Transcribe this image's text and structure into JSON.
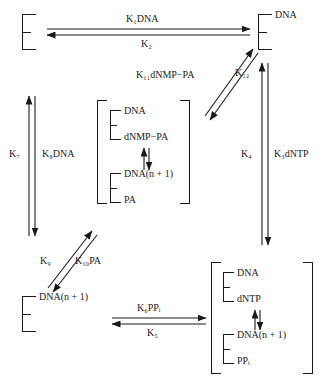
{
  "diagram": {
    "type": "reaction-scheme",
    "species": {
      "enzyme": "E",
      "dna": "DNA",
      "dnmp_pa": "dNMP−PA",
      "dna_n1": "DNA(n + 1)",
      "pa": "PA",
      "dntp": "dNTP",
      "ppi": "PP",
      "ppi_sub": "i"
    },
    "nodes": {
      "top_left": {
        "enzyme": "E",
        "ligands": []
      },
      "top_right": {
        "enzyme": "E",
        "ligands": [
          "DNA"
        ]
      },
      "center": {
        "enzyme_upper": "E",
        "upper": [
          "DNA",
          "dNMP−PA"
        ],
        "enzyme_lower": "E",
        "lower": [
          "DNA(n + 1)",
          "PA"
        ]
      },
      "bottom_left": {
        "enzyme": "E",
        "ligands": [
          "DNA(n + 1)"
        ]
      },
      "bottom_right": {
        "enzyme_upper": "E",
        "upper": [
          "DNA",
          "dNTP"
        ],
        "enzyme_lower": "E",
        "lower": [
          "DNA(n + 1)",
          "PP"
        ]
      }
    },
    "rate_constants": {
      "k1": {
        "sym": "K",
        "sub": "1",
        "ligand": "DNA"
      },
      "k2": {
        "sym": "K",
        "sub": "2",
        "ligand": ""
      },
      "k3": {
        "sym": "K",
        "sub": "3",
        "ligand": "dNTP"
      },
      "k4": {
        "sym": "K",
        "sub": "4",
        "ligand": ""
      },
      "k5": {
        "sym": "K",
        "sub": "5",
        "ligand": ""
      },
      "k6": {
        "sym": "K",
        "sub": "6",
        "ligand": "PP"
      },
      "k7": {
        "sym": "K",
        "sub": "7",
        "ligand": ""
      },
      "k8": {
        "sym": "K",
        "sub": "8",
        "ligand": "DNA"
      },
      "k9": {
        "sym": "K",
        "sub": "9",
        "ligand": ""
      },
      "k10": {
        "sym": "K",
        "sub": "10",
        "ligand": "PA"
      },
      "k11": {
        "sym": "K",
        "sub": "11",
        "ligand": "dNMP−PA"
      },
      "k12": {
        "sym": "K",
        "sub": "12",
        "ligand": ""
      }
    },
    "labels": {
      "k1_dna": "K₁DNA",
      "k2": "K₂",
      "k11_dnmp_pa": "K₁₁dNMP−PA",
      "k12": "K₁₂",
      "k7": "K₇",
      "k8_dna": "K₈DNA",
      "k4": "K₄",
      "k3_dntp": "K₃dNTP",
      "k9": "K₉",
      "k10_pa": "K₁₀PA",
      "k6_ppi": "K₆PPᵢ",
      "k5": "K₅",
      "dna": "DNA",
      "dnmp_pa": "dNMP−PA",
      "dna_n_plus_1": "DNA(n + 1)",
      "pa": "PA",
      "dntp": "dNTP",
      "ppi": "PPᵢ",
      "e": "E"
    },
    "colors": {
      "ink": "#1a1a1a",
      "background": "#ffffff"
    }
  }
}
